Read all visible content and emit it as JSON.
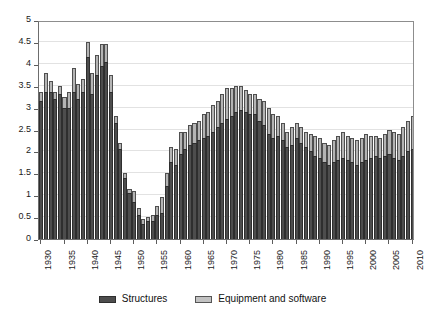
{
  "chart_data": {
    "type": "bar",
    "stacked": true,
    "title": "",
    "subtitle": "",
    "xlabel": "",
    "ylabel": "",
    "ylim": [
      0,
      5
    ],
    "ytick_step": 0.5,
    "yticks": [
      "0",
      "0.5",
      "1",
      "1.5",
      "2",
      "2.5",
      "3",
      "3.5",
      "4",
      "4.5",
      "5"
    ],
    "xlim": [
      1929,
      2011
    ],
    "xticks": [
      "1930",
      "1935",
      "1940",
      "1945",
      "1950",
      "1955",
      "1960",
      "1965",
      "1970",
      "1975",
      "1980",
      "1985",
      "1990",
      "1995",
      "2000",
      "2005",
      "2010"
    ],
    "grid": false,
    "legend_position": "bottom",
    "colors": {
      "structures": "#4d4d4d",
      "equipment": "#b4b4b4",
      "structures_edge": "#2e2e2e",
      "equipment_edge": "#4f4f4f",
      "axis": "#6d6d6d",
      "background": "#ffffff"
    },
    "categories": [
      1930,
      1931,
      1932,
      1933,
      1934,
      1935,
      1936,
      1937,
      1938,
      1939,
      1940,
      1941,
      1942,
      1943,
      1944,
      1945,
      1946,
      1947,
      1948,
      1949,
      1950,
      1951,
      1952,
      1953,
      1954,
      1955,
      1956,
      1957,
      1958,
      1959,
      1960,
      1961,
      1962,
      1963,
      1964,
      1965,
      1966,
      1967,
      1968,
      1969,
      1970,
      1971,
      1972,
      1973,
      1974,
      1975,
      1976,
      1977,
      1978,
      1979,
      1980,
      1981,
      1982,
      1983,
      1984,
      1985,
      1986,
      1987,
      1988,
      1989,
      1990,
      1991,
      1992,
      1993,
      1994,
      1995,
      1996,
      1997,
      1998,
      1999,
      2000,
      2001,
      2002,
      2003,
      2004,
      2005,
      2006,
      2007,
      2008,
      2009,
      2010
    ],
    "series": [
      {
        "name": "Structures",
        "values": [
          3.15,
          3.35,
          3.35,
          3.2,
          3.3,
          3.0,
          3.0,
          3.35,
          3.2,
          3.35,
          4.15,
          3.3,
          3.75,
          3.95,
          4.05,
          3.35,
          2.65,
          2.05,
          1.4,
          1.05,
          0.85,
          0.55,
          0.35,
          0.4,
          0.4,
          0.55,
          0.6,
          1.2,
          1.75,
          1.7,
          1.95,
          2.05,
          2.15,
          2.2,
          2.25,
          2.3,
          2.35,
          2.45,
          2.55,
          2.65,
          2.75,
          2.8,
          2.9,
          2.95,
          2.9,
          2.85,
          2.85,
          2.7,
          2.6,
          2.4,
          2.3,
          2.35,
          2.25,
          2.1,
          2.15,
          2.3,
          2.2,
          2.1,
          2.0,
          1.9,
          1.85,
          1.75,
          1.7,
          1.75,
          1.8,
          1.85,
          1.8,
          1.75,
          1.7,
          1.75,
          1.8,
          1.85,
          1.9,
          1.85,
          1.9,
          1.95,
          1.85,
          1.8,
          1.9,
          2.0,
          2.05
        ]
      },
      {
        "name": "Equipment and software",
        "values": [
          0.2,
          0.45,
          0.25,
          0.15,
          0.2,
          0.25,
          0.35,
          0.55,
          0.35,
          0.3,
          0.35,
          0.5,
          0.45,
          0.5,
          0.4,
          0.4,
          0.15,
          0.15,
          0.1,
          0.1,
          0.25,
          0.15,
          0.1,
          0.1,
          0.15,
          0.2,
          0.35,
          0.3,
          0.35,
          0.35,
          0.5,
          0.4,
          0.45,
          0.45,
          0.45,
          0.55,
          0.55,
          0.6,
          0.6,
          0.65,
          0.7,
          0.65,
          0.6,
          0.55,
          0.5,
          0.45,
          0.45,
          0.5,
          0.55,
          0.6,
          0.55,
          0.45,
          0.4,
          0.35,
          0.4,
          0.35,
          0.35,
          0.35,
          0.4,
          0.45,
          0.45,
          0.45,
          0.45,
          0.5,
          0.55,
          0.6,
          0.55,
          0.55,
          0.55,
          0.55,
          0.6,
          0.5,
          0.45,
          0.45,
          0.5,
          0.55,
          0.6,
          0.6,
          0.65,
          0.7,
          0.75
        ]
      }
    ]
  },
  "legend": {
    "items": [
      {
        "label": "Structures",
        "key": "structures"
      },
      {
        "label": "Equipment and software",
        "key": "equipment"
      }
    ]
  }
}
